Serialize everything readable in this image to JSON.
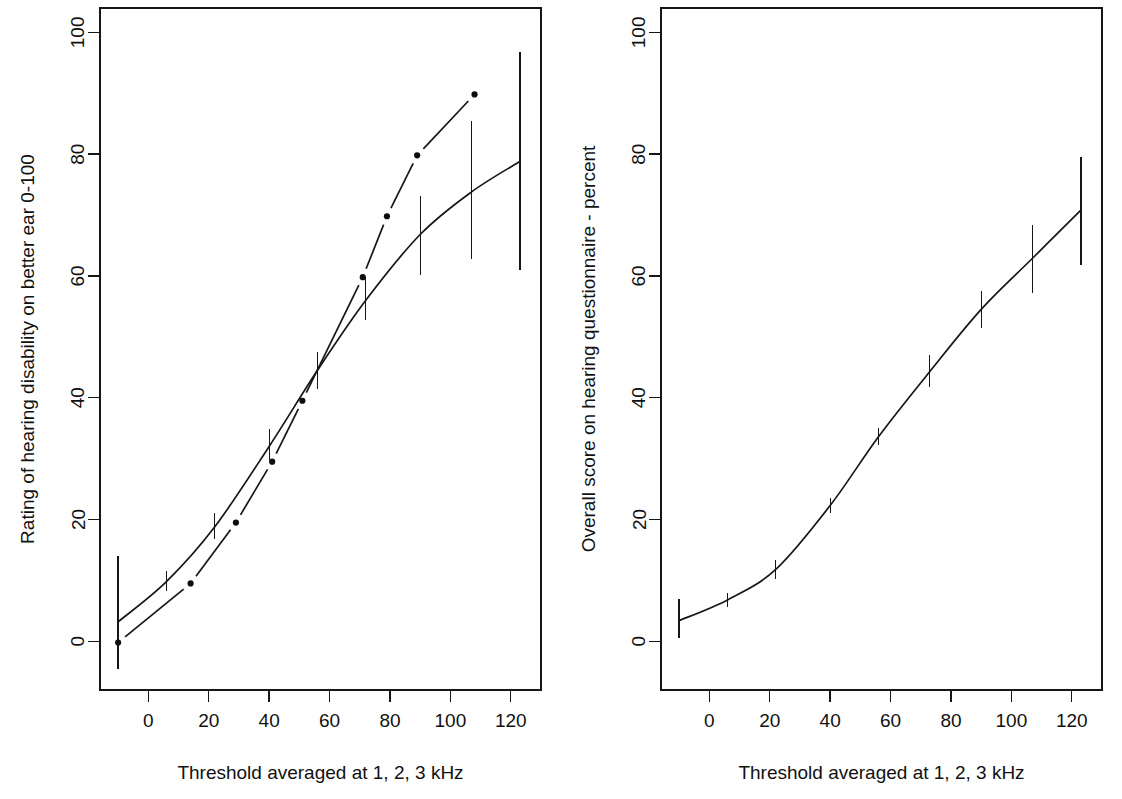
{
  "figure": {
    "background_color": "#ffffff",
    "ink_color": "#161616",
    "panel_count": 2
  },
  "chart_data": [
    {
      "panel": "left",
      "type": "line",
      "title": "",
      "xlabel": "Threshold averaged at 1, 2, 3 kHz",
      "ylabel": "Rating of hearing disability on better ear 0-100",
      "xlim": [
        -16,
        130
      ],
      "ylim": [
        -8,
        104
      ],
      "xticks": [
        0,
        20,
        40,
        60,
        80,
        100,
        120
      ],
      "xtick_labels": [
        "0",
        "20",
        "40",
        "60",
        "80",
        "100",
        "120"
      ],
      "yticks": [
        0,
        20,
        40,
        60,
        80,
        100
      ],
      "ytick_labels": [
        "0",
        "20",
        "40",
        "60",
        "80",
        "100"
      ],
      "grid": false,
      "legend": "none",
      "series": [
        {
          "name": "fitted-curve-with-error-bars",
          "style": "solid",
          "x": [
            -10,
            6,
            22,
            40,
            56,
            72,
            90,
            107,
            123
          ],
          "y": [
            3.2,
            9.8,
            18.8,
            32.0,
            44.5,
            56.0,
            66.8,
            73.8,
            78.8
          ],
          "error_low": [
            -4.5,
            8.2,
            16.8,
            29.8,
            41.5,
            52.8,
            60.2,
            62.8,
            61.0
          ],
          "error_high": [
            14.0,
            11.5,
            21.0,
            34.8,
            47.5,
            59.8,
            73.2,
            85.5,
            96.8
          ],
          "has_error_bars": true
        },
        {
          "name": "observed-means-broken-line",
          "style": "broken",
          "x": [
            -10,
            14,
            29,
            41,
            51,
            71,
            79,
            89,
            108
          ],
          "y": [
            -0.2,
            9.5,
            19.5,
            29.5,
            39.5,
            59.8,
            69.8,
            79.8,
            89.8
          ],
          "has_points": true,
          "has_error_bars": false
        }
      ]
    },
    {
      "panel": "right",
      "type": "line",
      "title": "",
      "xlabel": "Threshold averaged at 1, 2, 3 kHz",
      "ylabel": "Overall score on hearing questionnaire - percent",
      "xlim": [
        -16,
        130
      ],
      "ylim": [
        -8,
        104
      ],
      "xticks": [
        0,
        20,
        40,
        60,
        80,
        100,
        120
      ],
      "xtick_labels": [
        "0",
        "20",
        "40",
        "60",
        "80",
        "100",
        "120"
      ],
      "yticks": [
        0,
        20,
        40,
        60,
        80,
        100
      ],
      "ytick_labels": [
        "0",
        "20",
        "40",
        "60",
        "80",
        "100"
      ],
      "grid": false,
      "legend": "none",
      "series": [
        {
          "name": "fitted-curve-with-error-bars",
          "style": "solid",
          "x": [
            -10,
            6,
            22,
            40,
            56,
            73,
            90,
            107,
            123
          ],
          "y": [
            3.4,
            6.8,
            11.8,
            22.3,
            33.6,
            44.3,
            54.5,
            62.9,
            70.8
          ],
          "error_low": [
            0.6,
            5.6,
            10.2,
            21.0,
            32.2,
            41.8,
            51.5,
            57.2,
            61.8
          ],
          "error_high": [
            7.0,
            8.0,
            13.4,
            23.6,
            35.0,
            47.0,
            57.6,
            68.4,
            79.6
          ],
          "has_error_bars": true
        }
      ]
    }
  ]
}
